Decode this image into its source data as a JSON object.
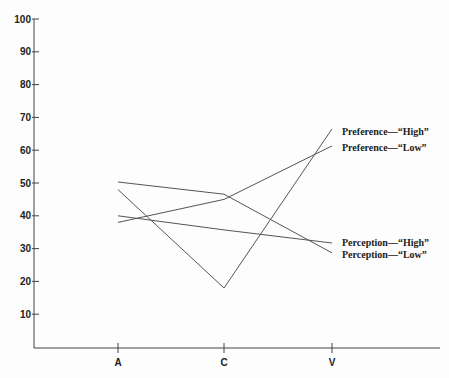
{
  "chart_data": {
    "type": "line",
    "title": "",
    "xlabel": "",
    "ylabel": "",
    "categories": [
      "A",
      "C",
      "V"
    ],
    "ylim": [
      0,
      100
    ],
    "yticks": [
      10,
      20,
      30,
      40,
      50,
      60,
      70,
      80,
      90,
      100
    ],
    "grid": false,
    "legend_position": "inline-right",
    "series": [
      {
        "name": "Preference—“High”",
        "values": [
          48,
          18,
          66.5
        ]
      },
      {
        "name": "Preference—“Low”",
        "values": [
          38,
          45,
          61.3
        ]
      },
      {
        "name": "Perception—“High”",
        "values": [
          40,
          35.7,
          31.7
        ]
      },
      {
        "name": "Perception—“Low”",
        "values": [
          50.3,
          46.6,
          28.7
        ]
      }
    ]
  }
}
